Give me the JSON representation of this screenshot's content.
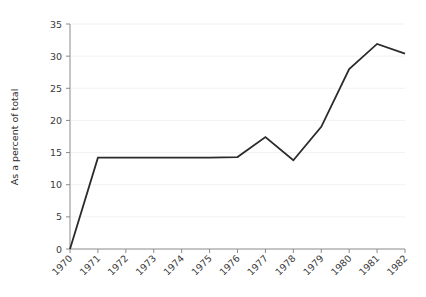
{
  "chart_data": {
    "type": "line",
    "title": "",
    "xlabel": "",
    "ylabel": "As a percent of total",
    "x": [
      "1970",
      "1971",
      "1972",
      "1973",
      "1974",
      "1975",
      "1976",
      "1977",
      "1978",
      "1979",
      "1980",
      "1981",
      "1982"
    ],
    "values": [
      0,
      14.2,
      14.2,
      14.2,
      14.2,
      14.2,
      14.3,
      17.4,
      13.8,
      19.0,
      28.0,
      31.9,
      30.4
    ],
    "series": [
      {
        "name": "As a percent of total",
        "values": [
          0,
          14.2,
          14.2,
          14.2,
          14.2,
          14.2,
          14.3,
          17.4,
          13.8,
          19.0,
          28.0,
          31.9,
          30.4
        ]
      }
    ],
    "ylim": [
      0,
      35
    ],
    "yticks": [
      0,
      5,
      10,
      15,
      20,
      25,
      30,
      35
    ],
    "ytick_labels": [
      "0",
      "5",
      "10",
      "15",
      "20",
      "25",
      "30",
      "35"
    ],
    "xtick_labels": [
      "1970",
      "1971",
      "1972",
      "1973",
      "1974",
      "1975",
      "1976",
      "1977",
      "1978",
      "1979",
      "1980",
      "1981",
      "1982"
    ],
    "xtick_rotation": 45,
    "grid": true,
    "grid_axis": "y",
    "legend": false,
    "legend_position": "none",
    "line_color": "#2b2b2b",
    "grid_color": "#f2f2f2",
    "axis_color": "#8a8a8a",
    "background_color": "#ffffff",
    "marker": "none"
  }
}
